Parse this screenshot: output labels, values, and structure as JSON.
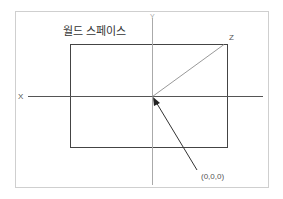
{
  "diagram": {
    "title": "월드 스페이스",
    "axes": {
      "x": "X",
      "y": "Y",
      "z": "Z"
    },
    "origin_label": "(0,0,0)",
    "colors": {
      "frame": "#cfcfcf",
      "rect": "#444444",
      "axis": "#9a9a9a",
      "xaxis": "#555555",
      "arrow": "#333333"
    }
  }
}
